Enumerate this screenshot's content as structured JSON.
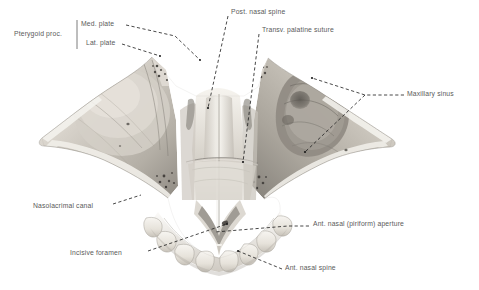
{
  "figure": {
    "background_color": "#ffffff",
    "label_color": "#5a5a5a",
    "leader_color": "#1a1a1a",
    "bone_light": "#e9e6e0",
    "bone_mid": "#c9c4bc",
    "bone_dark": "#8e8a83",
    "bone_shadow": "#5f5c57",
    "tooth_color": "#efece6"
  },
  "labels": [
    {
      "id": "pterygoid-proc",
      "text": "Pterygoid proc.",
      "x": 14,
      "y": 34,
      "anchor": "start",
      "bracket": true
    },
    {
      "id": "med-plate",
      "text": "Med. plate",
      "x": 81,
      "y": 25,
      "anchor": "start",
      "bracket": false
    },
    {
      "id": "lat-plate",
      "text": "Lat. plate",
      "x": 86,
      "y": 44,
      "anchor": "start",
      "bracket": false
    },
    {
      "id": "post-nasal-spine",
      "text": "Post. nasal spine",
      "x": 231,
      "y": 12,
      "anchor": "start",
      "bracket": false
    },
    {
      "id": "transv-palatine-suture",
      "text": "Transv. palatine suture",
      "x": 262,
      "y": 30,
      "anchor": "start",
      "bracket": false
    },
    {
      "id": "maxillary-sinus",
      "text": "Maxillary sinus",
      "x": 407,
      "y": 94,
      "anchor": "start",
      "bracket": false
    },
    {
      "id": "nasolacrimal-canal",
      "text": "Nasolacrimal canal",
      "x": 33,
      "y": 206,
      "anchor": "start",
      "bracket": false
    },
    {
      "id": "incisive-foramen",
      "text": "Incisive foramen",
      "x": 70,
      "y": 253,
      "anchor": "start",
      "bracket": false
    },
    {
      "id": "ant-nasal-aperture",
      "text": "Ant. nasal (piriform) aperture",
      "x": 313,
      "y": 224,
      "anchor": "start",
      "bracket": false
    },
    {
      "id": "ant-nasal-spine",
      "text": "Ant. nasal spine",
      "x": 285,
      "y": 268,
      "anchor": "start",
      "bracket": false
    }
  ],
  "leaders": [
    {
      "id": "leader-med-plate",
      "for": "med-plate",
      "points": "126,25 175,36 200,60",
      "dashed": true
    },
    {
      "id": "leader-lat-plate",
      "for": "lat-plate",
      "points": "122,44 160,56",
      "dashed": true
    },
    {
      "id": "leader-post-nasal-spine",
      "for": "post-nasal-spine",
      "points": "228,16 208,108",
      "dashed": true
    },
    {
      "id": "leader-transv-palatine-suture",
      "for": "transv-palatine-suture",
      "points": "259,34 243,162",
      "dashed": true
    },
    {
      "id": "leader-maxillary-sinus-upper",
      "for": "maxillary-sinus",
      "points": "404,95 365,95 312,78",
      "dashed": true
    },
    {
      "id": "leader-maxillary-sinus-lower",
      "for": "maxillary-sinus",
      "points": "365,95 305,152",
      "dashed": true
    },
    {
      "id": "leader-nasolacrimal-canal",
      "for": "nasolacrimal-canal",
      "points": "113,204 141,195",
      "dashed": true
    },
    {
      "id": "leader-incisive-foramen",
      "for": "incisive-foramen",
      "points": "148,251 227,224",
      "dashed": true
    },
    {
      "id": "leader-ant-nasal-aperture",
      "for": "ant-nasal-aperture",
      "points": "309,226 288,226 215,232",
      "dashed": true
    },
    {
      "id": "leader-ant-nasal-spine",
      "for": "ant-nasal-spine",
      "points": "282,269 238,251",
      "dashed": true
    }
  ],
  "bracket": {
    "id": "pterygoid-bracket",
    "x": 77,
    "y_top": 20,
    "y_bottom": 49
  }
}
